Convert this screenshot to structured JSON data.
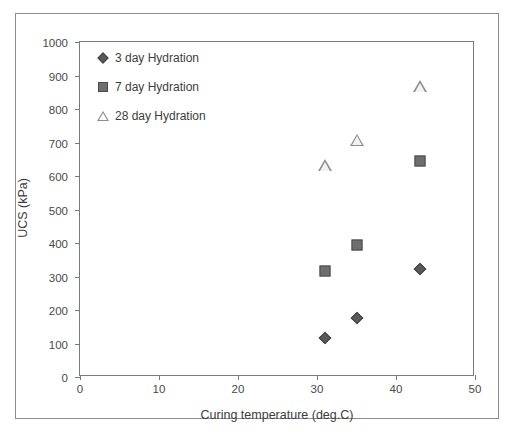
{
  "chart_data": {
    "type": "scatter",
    "title": "",
    "xlabel": "Curing temperature (deg.C)",
    "ylabel": "UCS (kPa)",
    "xlim": [
      0,
      50
    ],
    "ylim": [
      0,
      1000
    ],
    "xticks": [
      0,
      10,
      20,
      30,
      40,
      50
    ],
    "yticks": [
      0,
      100,
      200,
      300,
      400,
      500,
      600,
      700,
      800,
      900,
      1000
    ],
    "grid": false,
    "legend_position": "upper-left",
    "series": [
      {
        "name": "3 day Hydration",
        "marker": "diamond",
        "color": "#595959",
        "points": [
          {
            "x": 31,
            "y": 115
          },
          {
            "x": 35,
            "y": 175
          },
          {
            "x": 43,
            "y": 323
          }
        ]
      },
      {
        "name": "7 day Hydration",
        "marker": "square",
        "color": "#6e6e6e",
        "points": [
          {
            "x": 31,
            "y": 315
          },
          {
            "x": 35,
            "y": 393
          },
          {
            "x": 43,
            "y": 645
          }
        ]
      },
      {
        "name": "28 day Hydration",
        "marker": "triangle",
        "color": "#8e8e8e",
        "points": [
          {
            "x": 31,
            "y": 633
          },
          {
            "x": 35,
            "y": 708
          },
          {
            "x": 43,
            "y": 868
          }
        ]
      }
    ]
  },
  "axes": {
    "y_title": "UCS (kPa)",
    "x_title": "Curing temperature (deg.C)",
    "y_tick_labels": [
      "0",
      "100",
      "200",
      "300",
      "400",
      "500",
      "600",
      "700",
      "800",
      "900",
      "1000"
    ],
    "x_tick_labels": [
      "0",
      "10",
      "20",
      "30",
      "40",
      "50"
    ]
  },
  "legend": {
    "items": [
      {
        "label": "3 day Hydration",
        "marker": "diamond-marker-icon"
      },
      {
        "label": "7 day Hydration",
        "marker": "square-marker-icon"
      },
      {
        "label": "28 day Hydration",
        "marker": "triangle-marker-icon"
      }
    ]
  },
  "colors": {
    "axis": "#7a7a7a",
    "text": "#3d3d3d",
    "frame": "#8d8d8d",
    "background": "#ffffff"
  }
}
